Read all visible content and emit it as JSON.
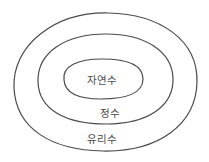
{
  "diagram": {
    "type": "nested-sets",
    "stroke_color": "#4a4a4a",
    "background": "#ffffff",
    "sets": [
      {
        "id": "outer",
        "label": "유리수",
        "cx": 105,
        "cy": 82,
        "rx": 92,
        "ry": 70,
        "label_x": 102,
        "label_y": 138
      },
      {
        "id": "middle",
        "label": "정수",
        "cx": 105,
        "cy": 79,
        "rx": 67,
        "ry": 45,
        "label_x": 109,
        "label_y": 112
      },
      {
        "id": "inner",
        "label": "자연수",
        "cx": 103,
        "cy": 78,
        "rx": 40,
        "ry": 20,
        "label_x": 102,
        "label_y": 79
      }
    ]
  }
}
